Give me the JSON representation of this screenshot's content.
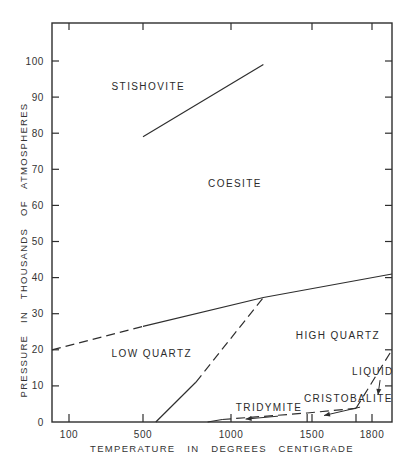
{
  "chart_data": {
    "type": "line",
    "title": "",
    "xlabel": "TEMPERATURE   IN   DEGREES   CENTIGRADE",
    "ylabel": "PRESSURE   IN   THOUSANDS   OF   ATMOSPHERES",
    "xlim": [
      -10,
      1900
    ],
    "ylim": [
      0,
      110
    ],
    "x_ticks": [
      {
        "value": 100,
        "label": "100"
      },
      {
        "value": 500,
        "label": "500"
      },
      {
        "value": 1000,
        "label": "1000"
      },
      {
        "value": 1500,
        "label": "1500"
      },
      {
        "value": 1800,
        "label": "1800"
      }
    ],
    "y_ticks": [
      {
        "value": 0,
        "label": "0"
      },
      {
        "value": 10,
        "label": "10"
      },
      {
        "value": 20,
        "label": "20"
      },
      {
        "value": 30,
        "label": "30"
      },
      {
        "value": 40,
        "label": "40"
      },
      {
        "value": 50,
        "label": "50"
      },
      {
        "value": 60,
        "label": "60"
      },
      {
        "value": 70,
        "label": "70"
      },
      {
        "value": 80,
        "label": "80"
      },
      {
        "value": 90,
        "label": "90"
      },
      {
        "value": 100,
        "label": "100"
      }
    ],
    "grid": false,
    "legend": null,
    "series": [
      {
        "name": "Coesite–Stishovite boundary",
        "style": "solid",
        "points": [
          [
            500,
            79
          ],
          [
            1200,
            99
          ]
        ]
      },
      {
        "name": "Quartz–Coesite boundary (low T, inferred)",
        "style": "dashed",
        "points": [
          [
            -10,
            20
          ],
          [
            500,
            26.5
          ]
        ]
      },
      {
        "name": "Quartz–Coesite boundary",
        "style": "solid",
        "points": [
          [
            500,
            26.5
          ],
          [
            1200,
            34.5
          ],
          [
            1900,
            41
          ]
        ]
      },
      {
        "name": "Low–High quartz boundary (measured)",
        "style": "solid",
        "points": [
          [
            573,
            0
          ],
          [
            800,
            11
          ]
        ]
      },
      {
        "name": "Low–High quartz boundary (inferred)",
        "style": "dashed",
        "points": [
          [
            800,
            11
          ],
          [
            1200,
            34.5
          ]
        ]
      },
      {
        "name": "Quartz–Tridymite boundary",
        "style": "solid",
        "points": [
          [
            867,
            0
          ],
          [
            950,
            0.7
          ]
        ]
      },
      {
        "name": "Tridymite / Cristobalite boundary",
        "style": "dashed",
        "points": [
          [
            950,
            0.7
          ],
          [
            1470,
            2.5
          ],
          [
            1720,
            3.8
          ]
        ]
      },
      {
        "name": "Melting curve",
        "style": "dashed",
        "points": [
          [
            1720,
            3.8
          ],
          [
            1900,
            20
          ]
        ]
      }
    ],
    "annotations": [
      {
        "text": "STISHOVITE",
        "x": 330,
        "y": 92
      },
      {
        "text": "COESITE",
        "x": 870,
        "y": 65
      },
      {
        "text": "LOW    QUARTZ",
        "x": 330,
        "y": 18
      },
      {
        "text": "HIGH    QUARTZ",
        "x": 1400,
        "y": 23
      },
      {
        "text": "LIQUID",
        "x": 1700,
        "y": 13,
        "arrow_to": [
          1830,
          7.5
        ]
      },
      {
        "text": "CRISTOBALITE",
        "x": 1450,
        "y": 5.5,
        "arrow_to": [
          1560,
          1.8
        ]
      },
      {
        "text": "TRIDYMITE",
        "x": 1030,
        "y": 3,
        "arrow_to": [
          1090,
          0.8
        ]
      }
    ]
  }
}
